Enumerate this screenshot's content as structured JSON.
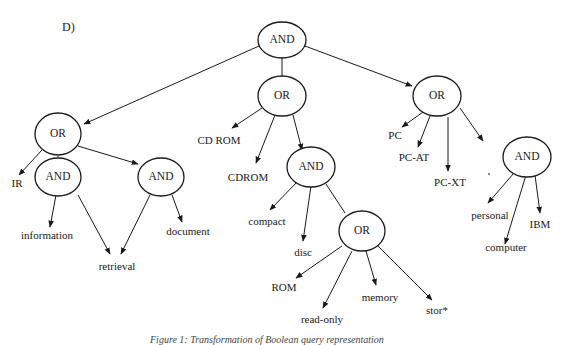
{
  "panel_label": "D)",
  "caption": "Figure 1: Transformation of Boolean query representation",
  "nodes": {
    "root": {
      "label": "AND",
      "x": 282,
      "y": 40
    },
    "or_left": {
      "label": "OR",
      "x": 58,
      "y": 134
    },
    "or_mid": {
      "label": "OR",
      "x": 282,
      "y": 96
    },
    "or_right": {
      "label": "OR",
      "x": 437,
      "y": 96
    },
    "and_info": {
      "label": "AND",
      "x": 58,
      "y": 177
    },
    "and_doc": {
      "label": "AND",
      "x": 155,
      "y": 177
    },
    "and_compact": {
      "label": "AND",
      "x": 311,
      "y": 167
    },
    "or_rom": {
      "label": "OR",
      "x": 358,
      "y": 231
    },
    "and_personal": {
      "label": "AND",
      "x": 500,
      "y": 157
    }
  },
  "leaves": {
    "ir": {
      "label": "IR",
      "x": 20,
      "y": 186
    },
    "information": {
      "label": "information",
      "x": 47,
      "y": 236
    },
    "retrieval": {
      "label": "retrieval",
      "x": 123,
      "y": 266
    },
    "document": {
      "label": "document",
      "x": 185,
      "y": 232
    },
    "cd_rom": {
      "label": "CD ROM",
      "x": 215,
      "y": 140
    },
    "cdrom": {
      "label": "CDROM",
      "x": 228,
      "y": 176
    },
    "compact": {
      "label": "compact",
      "x": 272,
      "y": 222
    },
    "disc": {
      "label": "disc",
      "x": 300,
      "y": 252
    },
    "rom": {
      "label": "ROM",
      "x": 282,
      "y": 287
    },
    "read_only": {
      "label": "read-only",
      "x": 322,
      "y": 319
    },
    "memory": {
      "label": "memory",
      "x": 371,
      "y": 297
    },
    "stor": {
      "label": "stor*",
      "x": 440,
      "y": 310
    },
    "pc": {
      "label": "PC",
      "x": 393,
      "y": 135
    },
    "pc_at": {
      "label": "PC-AT",
      "x": 426,
      "y": 157
    },
    "pc_xt": {
      "label": "PC-XT",
      "x": 463,
      "y": 183
    },
    "personal": {
      "label": "personal",
      "x": 465,
      "y": 224
    },
    "computer": {
      "label": "computer",
      "x": 498,
      "y": 256
    },
    "ibm": {
      "label": "IBM",
      "x": 537,
      "y": 224
    }
  }
}
